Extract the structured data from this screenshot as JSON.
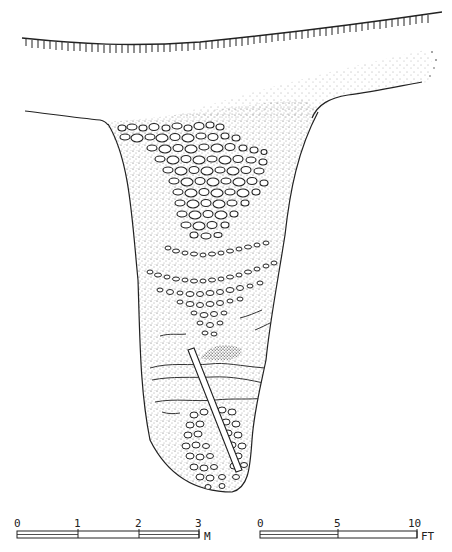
{
  "figure": {
    "type": "archaeological-profile-section",
    "features": [
      {
        "name": "ground-surface",
        "style": "hatched-line"
      },
      {
        "name": "upper-sediment-wedge",
        "style": "stippled"
      },
      {
        "name": "pit-fill",
        "style": "stippled"
      },
      {
        "name": "upper-cobble-cluster",
        "style": "ovals"
      },
      {
        "name": "cobble-band-1",
        "style": "ovals"
      },
      {
        "name": "cobble-band-2",
        "style": "ovals"
      },
      {
        "name": "middle-cobble-wedge",
        "style": "ovals"
      },
      {
        "name": "dense-sediment-lens",
        "style": "dense-stipple"
      },
      {
        "name": "wavy-strata-lines",
        "style": "lines"
      },
      {
        "name": "diagonal-pole",
        "style": "outlined-bar"
      },
      {
        "name": "lower-cobble-cluster",
        "style": "ovals"
      }
    ]
  },
  "scale_bars": {
    "metric": {
      "ticks": [
        "0",
        "1",
        "2",
        "3"
      ],
      "unit": "M"
    },
    "imperial": {
      "ticks": [
        "0",
        "5",
        "10"
      ],
      "unit": "FT"
    }
  }
}
